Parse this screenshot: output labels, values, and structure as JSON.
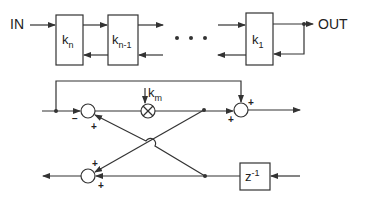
{
  "diagram": {
    "type": "lattice-filter-block-diagram",
    "top_chain": {
      "input_label": "IN",
      "output_label": "OUT",
      "stages": [
        {
          "label": "k",
          "subscript": "n"
        },
        {
          "label": "k",
          "subscript": "n-1"
        },
        {
          "label": "k",
          "subscript": "1"
        }
      ],
      "ellipsis": "• • •"
    },
    "lattice_stage": {
      "coefficient": {
        "label": "k",
        "subscript": "m"
      },
      "delay": {
        "label": "z",
        "superscript": "-1"
      },
      "top_sum_signs": {
        "left": "−",
        "bottom": "+"
      },
      "right_sum_signs": {
        "top": "+",
        "left": "+"
      },
      "bottom_sum_signs": {
        "top": "+",
        "bottom": "+"
      }
    },
    "colors": {
      "line": "#333333",
      "background": "#ffffff"
    }
  }
}
